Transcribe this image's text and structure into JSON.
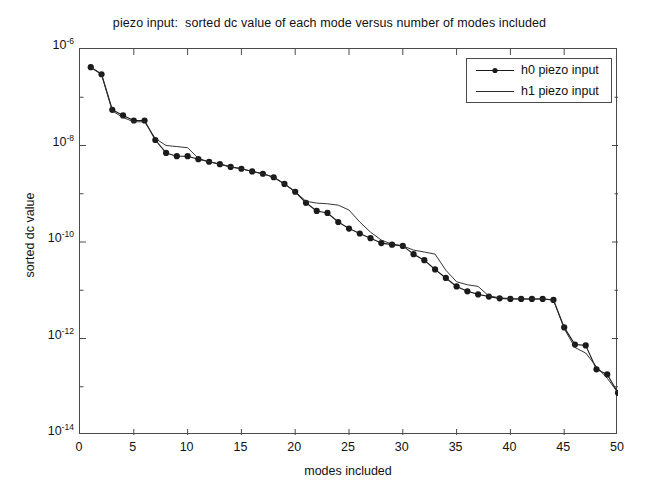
{
  "chart_data": {
    "type": "line",
    "title": "piezo input:  sorted dc value of each mode versus number of modes included",
    "xlabel": "modes included",
    "ylabel": "sorted dc value",
    "yscale": "log",
    "xlim": [
      0,
      50
    ],
    "ylim": [
      1e-14,
      1e-06
    ],
    "grid": false,
    "legend_position": "upper right",
    "xticks": [
      0,
      5,
      10,
      15,
      20,
      25,
      30,
      35,
      40,
      45,
      50
    ],
    "xtick_labels": [
      "0",
      "5",
      "10",
      "15",
      "20",
      "25",
      "30",
      "35",
      "40",
      "45",
      "50"
    ],
    "yticks": [
      1e-06,
      1e-08,
      1e-10,
      1e-12,
      1e-14
    ],
    "ytick_labels": [
      "10-6",
      "10-8",
      "10-10",
      "10-12",
      "10-14"
    ],
    "ytick_mantissa": "10",
    "ytick_exponents": [
      "-6",
      "-8",
      "-10",
      "-12",
      "-14"
    ],
    "x": [
      1,
      2,
      3,
      4,
      5,
      6,
      7,
      8,
      9,
      10,
      11,
      12,
      13,
      14,
      15,
      16,
      17,
      18,
      19,
      20,
      21,
      22,
      23,
      24,
      25,
      26,
      27,
      28,
      29,
      30,
      31,
      32,
      33,
      34,
      35,
      36,
      37,
      38,
      39,
      40,
      41,
      42,
      43,
      44,
      45,
      46,
      47,
      48,
      49,
      50
    ],
    "series": [
      {
        "name": "h0 piezo input",
        "marker": "filled-circle",
        "linestyle": "solid",
        "color": "#1a1a1a",
        "values": [
          4.2e-07,
          3e-07,
          5.5e-08,
          4.2e-08,
          3.3e-08,
          3.3e-08,
          1.3e-08,
          7e-09,
          6e-09,
          6e-09,
          5.2e-09,
          4.6e-09,
          4.1e-09,
          3.6e-09,
          3.3e-09,
          2.9e-09,
          2.6e-09,
          2.2e-09,
          1.6e-09,
          1.1e-09,
          6.5e-10,
          4.4e-10,
          4e-10,
          2.6e-10,
          1.9e-10,
          1.5e-10,
          1.2e-10,
          9.5e-11,
          8.8e-11,
          8.3e-11,
          5.6e-11,
          4.2e-11,
          2.7e-11,
          1.8e-11,
          1.2e-11,
          9.5e-12,
          8.2e-12,
          7.4e-12,
          6.8e-12,
          6.6e-12,
          6.6e-12,
          6.6e-12,
          6.6e-12,
          6.3e-12,
          1.7e-12,
          7.5e-13,
          7.2e-13,
          2.3e-13,
          1.8e-13,
          7.5e-14
        ]
      },
      {
        "name": "h1 piezo input",
        "marker": "none",
        "linestyle": "solid",
        "color": "#2a2a2a",
        "values": [
          4.2e-07,
          3e-07,
          5.2e-08,
          3.8e-08,
          3.1e-08,
          3.1e-08,
          1.4e-08,
          1e-08,
          9.5e-09,
          9e-09,
          5.4e-09,
          4.6e-09,
          4.1e-09,
          3.6e-09,
          3.3e-09,
          2.9e-09,
          2.6e-09,
          2.2e-09,
          1.6e-09,
          1.1e-09,
          7e-10,
          6.4e-10,
          6.2e-10,
          5.8e-10,
          4.6e-10,
          2.6e-10,
          1.6e-10,
          1.1e-10,
          9e-11,
          8.3e-11,
          6.8e-11,
          6.2e-11,
          5.6e-11,
          2.6e-11,
          1.5e-11,
          1.3e-11,
          1.2e-11,
          7.6e-12,
          7e-12,
          6.7e-12,
          6.6e-12,
          6.6e-12,
          6.6e-12,
          6.3e-12,
          1.6e-12,
          6.5e-13,
          5e-13,
          2.6e-13,
          1.5e-13,
          7.5e-14
        ]
      }
    ]
  },
  "legend": {
    "entries": [
      {
        "label": "h0 piezo input"
      },
      {
        "label": "h1 piezo input"
      }
    ]
  }
}
